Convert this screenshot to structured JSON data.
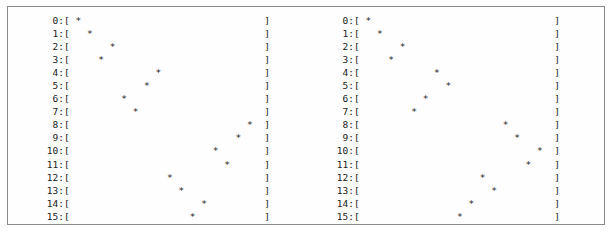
{
  "figure": {
    "type": "ascii-scatter-pair",
    "panel_count": 2,
    "row_count": 16,
    "track_width": 34,
    "marker": "*",
    "bracket_open": "[",
    "bracket_close": "]",
    "label_suffix": ":",
    "border_color": "#8a8a8a",
    "text_color": "#1b1b1b",
    "background_color": "#ffffff"
  },
  "row_labels": [
    "0",
    "1",
    "2",
    "3",
    "4",
    "5",
    "6",
    "7",
    "8",
    "9",
    "10",
    "11",
    "12",
    "13",
    "14",
    "15"
  ],
  "panels": [
    {
      "name": "left-panel",
      "rows": [
        {
          "label": "0:",
          "position": 2
        },
        {
          "label": "1:",
          "position": 4
        },
        {
          "label": "2:",
          "position": 8
        },
        {
          "label": "3:",
          "position": 6
        },
        {
          "label": "4:",
          "position": 16
        },
        {
          "label": "5:",
          "position": 14
        },
        {
          "label": "6:",
          "position": 10
        },
        {
          "label": "7:",
          "position": 12
        },
        {
          "label": "8:",
          "position": 32
        },
        {
          "label": "9:",
          "position": 30
        },
        {
          "label": "10:",
          "position": 26
        },
        {
          "label": "11:",
          "position": 28
        },
        {
          "label": "12:",
          "position": 18
        },
        {
          "label": "13:",
          "position": 20
        },
        {
          "label": "14:",
          "position": 24
        },
        {
          "label": "15:",
          "position": 22
        }
      ]
    },
    {
      "name": "right-panel",
      "rows": [
        {
          "label": "0:",
          "position": 2
        },
        {
          "label": "1:",
          "position": 4
        },
        {
          "label": "2:",
          "position": 8
        },
        {
          "label": "3:",
          "position": 6
        },
        {
          "label": "4:",
          "position": 14
        },
        {
          "label": "5:",
          "position": 16
        },
        {
          "label": "6:",
          "position": 12
        },
        {
          "label": "7:",
          "position": 10
        },
        {
          "label": "8:",
          "position": 26
        },
        {
          "label": "9:",
          "position": 28
        },
        {
          "label": "10:",
          "position": 32
        },
        {
          "label": "11:",
          "position": 30
        },
        {
          "label": "12:",
          "position": 22
        },
        {
          "label": "13:",
          "position": 24
        },
        {
          "label": "14:",
          "position": 20
        },
        {
          "label": "15:",
          "position": 18
        }
      ]
    }
  ],
  "chart_data": {
    "type": "scatter",
    "title": "",
    "xlabel": "",
    "ylabel": "",
    "grid": false,
    "legend": null,
    "xlim": [
      1,
      34
    ],
    "ylim": [
      0,
      15
    ],
    "series": [
      {
        "name": "left-panel",
        "x": [
          2,
          4,
          8,
          6,
          16,
          14,
          10,
          12,
          32,
          30,
          26,
          28,
          18,
          20,
          24,
          22
        ],
        "y": [
          0,
          1,
          2,
          3,
          4,
          5,
          6,
          7,
          8,
          9,
          10,
          11,
          12,
          13,
          14,
          15
        ]
      },
      {
        "name": "right-panel",
        "x": [
          2,
          4,
          8,
          6,
          14,
          16,
          12,
          10,
          26,
          28,
          32,
          30,
          22,
          24,
          20,
          18
        ],
        "y": [
          0,
          1,
          2,
          3,
          4,
          5,
          6,
          7,
          8,
          9,
          10,
          11,
          12,
          13,
          14,
          15
        ]
      }
    ]
  }
}
